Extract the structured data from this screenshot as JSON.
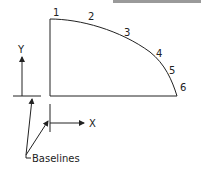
{
  "diagram": {
    "point_labels": [
      "1",
      "2",
      "3",
      "4",
      "5",
      "6"
    ],
    "axis_labels": {
      "x": "X",
      "y": "Y"
    },
    "callout": "Baselines",
    "colors": {
      "line": "#222222",
      "topbar": "#9a9a9a",
      "background": "#ffffff"
    }
  }
}
